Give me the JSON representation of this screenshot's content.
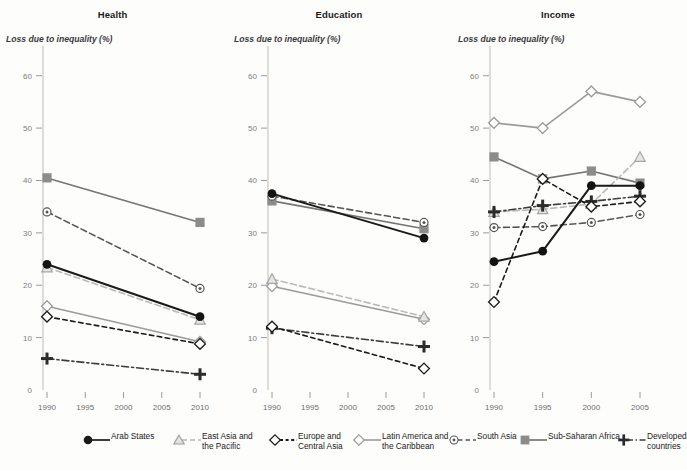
{
  "figure": {
    "axis_caption": "Loss due to inequality (%)",
    "y_ticks": [
      0,
      10,
      20,
      30,
      40,
      50,
      60
    ],
    "ylim": [
      0,
      63
    ]
  },
  "panels": [
    {
      "key": "health",
      "title": "Health"
    },
    {
      "key": "education",
      "title": "Education"
    },
    {
      "key": "income",
      "title": "Income"
    }
  ],
  "legend": {
    "items": [
      {
        "name": "arab-states",
        "label": "Arab States",
        "color": "#1a1a1a",
        "marker": "circle",
        "dash": "solid"
      },
      {
        "name": "east-asia-and-the-pacific",
        "label": "East Asia and\nthe Pacific",
        "color": "#b9b9b9",
        "marker": "triangle",
        "dash": "dash"
      },
      {
        "name": "europe-and-central-asia",
        "label": "Europe and\nCentral Asia",
        "color": "#1a1a1a",
        "marker": "diamond",
        "dash": "dashed-short"
      },
      {
        "name": "latin-america-and-the-caribbean",
        "label": "Latin America and\nthe Caribbean",
        "color": "#9b9b9b",
        "marker": "diamond",
        "dash": "solid"
      },
      {
        "name": "south-asia",
        "label": "South Asia",
        "color": "#565656",
        "marker": "circle-dot",
        "dash": "dash"
      },
      {
        "name": "sub-saharan-africa",
        "label": "Sub-Saharan Africa",
        "color": "#757575",
        "marker": "square",
        "dash": "solid"
      },
      {
        "name": "developed-countries",
        "label": "Developed\ncountries",
        "color": "#3c3c3c",
        "marker": "plus",
        "dash": "dashdot"
      }
    ]
  },
  "chart_data": [
    {
      "type": "line",
      "title": "Health",
      "xlabel": "",
      "ylabel": "Loss due to inequality (%)",
      "ylim": [
        0,
        63
      ],
      "grid": false,
      "legend_position": "bottom",
      "categories": [
        "1990",
        "1995",
        "2000",
        "2005",
        "2010"
      ],
      "series": [
        {
          "name": "Arab States",
          "values": [
            24.0,
            null,
            null,
            null,
            14.0
          ]
        },
        {
          "name": "East Asia and the Pacific",
          "values": [
            23.4,
            null,
            null,
            null,
            13.4
          ]
        },
        {
          "name": "Europe and Central Asia",
          "values": [
            14.0,
            null,
            null,
            null,
            8.8
          ]
        },
        {
          "name": "Latin America and the Caribbean",
          "values": [
            16.0,
            null,
            null,
            null,
            9.2
          ]
        },
        {
          "name": "South Asia",
          "values": [
            34.0,
            null,
            null,
            null,
            19.4
          ]
        },
        {
          "name": "Sub-Saharan Africa",
          "values": [
            40.5,
            null,
            null,
            null,
            32.0
          ]
        },
        {
          "name": "Developed countries",
          "values": [
            6.0,
            null,
            null,
            null,
            3.0
          ]
        }
      ]
    },
    {
      "type": "line",
      "title": "Education",
      "xlabel": "",
      "ylabel": "Loss due to inequality (%)",
      "ylim": [
        0,
        63
      ],
      "grid": false,
      "legend_position": "bottom",
      "categories": [
        "1990",
        "1995",
        "2000",
        "2005",
        "2010"
      ],
      "series": [
        {
          "name": "Arab States",
          "values": [
            37.5,
            null,
            null,
            null,
            29.0
          ]
        },
        {
          "name": "East Asia and the Pacific",
          "values": [
            21.2,
            null,
            null,
            null,
            14.0
          ]
        },
        {
          "name": "Europe and Central Asia",
          "values": [
            12.1,
            null,
            null,
            null,
            4.1
          ]
        },
        {
          "name": "Latin America and the Caribbean",
          "values": [
            19.8,
            null,
            null,
            null,
            13.5
          ]
        },
        {
          "name": "South Asia",
          "values": [
            37.0,
            null,
            null,
            null,
            32.0
          ]
        },
        {
          "name": "Sub-Saharan Africa",
          "values": [
            36.1,
            null,
            null,
            null,
            30.8
          ]
        },
        {
          "name": "Developed countries",
          "values": [
            11.8,
            null,
            null,
            null,
            8.3
          ]
        }
      ]
    },
    {
      "type": "line",
      "title": "Income",
      "xlabel": "",
      "ylabel": "Loss due to inequality (%)",
      "ylim": [
        0,
        63
      ],
      "grid": false,
      "legend_position": "bottom",
      "categories": [
        "1990",
        "1995",
        "2000",
        "2005"
      ],
      "series": [
        {
          "name": "Arab States",
          "values": [
            24.5,
            26.5,
            39.0,
            39.0
          ]
        },
        {
          "name": "East Asia and the Pacific",
          "values": [
            34.0,
            34.5,
            35.5,
            44.5
          ]
        },
        {
          "name": "Europe and Central Asia",
          "values": [
            16.8,
            40.3,
            35.0,
            36.0
          ]
        },
        {
          "name": "Latin America and the Caribbean",
          "values": [
            51.0,
            50.0,
            57.0,
            55.0
          ]
        },
        {
          "name": "South Asia",
          "values": [
            31.0,
            31.2,
            32.0,
            33.5
          ]
        },
        {
          "name": "Sub-Saharan Africa",
          "values": [
            44.5,
            40.3,
            41.8,
            39.5
          ]
        },
        {
          "name": "Developed countries",
          "values": [
            34.0,
            35.2,
            36.0,
            37.0
          ]
        }
      ]
    }
  ]
}
